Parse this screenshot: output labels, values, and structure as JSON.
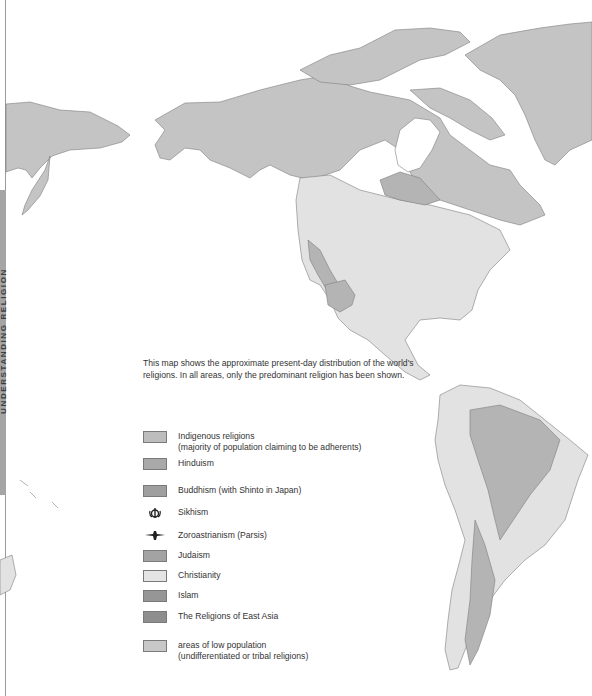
{
  "side_tab": {
    "label": "UNDERSTANDING RELIGION"
  },
  "intro_text": "This map shows the approximate present-day distribution of the world's religions. In all areas, only the predominant religion has been shown.",
  "legend": {
    "items": [
      {
        "key": "indigenous",
        "type": "swatch",
        "color": "#bdbdbd",
        "label": "Indigenous religions",
        "sublabel": "(majority of population claiming to be adherents)"
      },
      {
        "key": "hinduism",
        "type": "swatch",
        "color": "#a9a9a9",
        "label": "Hinduism"
      },
      {
        "key": "buddhism",
        "type": "swatch",
        "color": "#9f9f9f",
        "label": "Buddhism (with Shinto in Japan)"
      },
      {
        "key": "sikhism",
        "type": "icon",
        "icon": "khanda-icon",
        "label": "Sikhism"
      },
      {
        "key": "zoroastrianism",
        "type": "icon",
        "icon": "faravahar-icon",
        "label": "Zoroastrianism (Parsis)"
      },
      {
        "key": "judaism",
        "type": "swatch",
        "color": "#a3a3a3",
        "label": "Judaism"
      },
      {
        "key": "christianity",
        "type": "swatch",
        "color": "#e4e4e4",
        "label": "Christianity"
      },
      {
        "key": "islam",
        "type": "swatch",
        "color": "#969696",
        "label": "Islam"
      },
      {
        "key": "east_asia",
        "type": "swatch",
        "color": "#8e8e8e",
        "label": "The Religions of East Asia"
      },
      {
        "key": "low_population",
        "type": "swatch",
        "color": "#c8c8c8",
        "label": "areas of low population",
        "sublabel": "(undifferentiated or tribal religions)"
      }
    ]
  },
  "map_colors": {
    "low_population": "#c4c4c4",
    "christianity": "#e2e2e2",
    "indigenous": "#b4b4b4",
    "border": "#7d7d7d"
  }
}
